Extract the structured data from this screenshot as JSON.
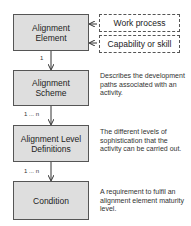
{
  "diagram": {
    "nodes": [
      {
        "id": "alignment-element",
        "label": "Alignment Element",
        "line1": "Alignment",
        "line2": "Element"
      },
      {
        "id": "alignment-scheme",
        "label": "Alignment Scheme",
        "line1": "Alignment",
        "line2": "Scheme",
        "description": "Describes the development paths associated with an activity."
      },
      {
        "id": "alignment-level-definitions",
        "label": "Alignment Level Definitions",
        "line1": "Alignment Level",
        "line2": "Definitions",
        "description": "The different levels of sophistication that the activity can be carried out."
      },
      {
        "id": "condition",
        "label": "Condition",
        "line1": "Condition",
        "description": "A requirement to fulfil an alignment element maturity level."
      }
    ],
    "inputs": [
      {
        "id": "work-process",
        "label": "Work process"
      },
      {
        "id": "capability-or-skill",
        "label": "Capability or skill"
      }
    ],
    "edges": [
      {
        "from": "alignment-element",
        "to": "alignment-scheme",
        "multiplicity": "1"
      },
      {
        "from": "alignment-scheme",
        "to": "alignment-level-definitions",
        "multiplicity": "1 ... n"
      },
      {
        "from": "alignment-level-definitions",
        "to": "condition",
        "multiplicity": "1 ... n"
      },
      {
        "from": "work-process",
        "to": "alignment-element",
        "multiplicity": ""
      },
      {
        "from": "capability-or-skill",
        "to": "alignment-element",
        "multiplicity": ""
      }
    ],
    "colors": {
      "box_fill": "#dedede",
      "border": "#555555",
      "text": "#222222"
    }
  }
}
